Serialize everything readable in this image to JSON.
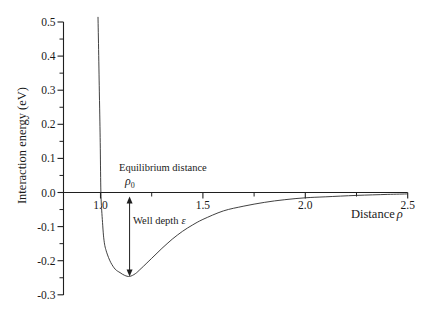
{
  "figure": {
    "background": "#ffffff",
    "line_color": "#1f1f1f",
    "curve_color": "#2b2b2b",
    "text_color": "#1a1a1a"
  },
  "chart_data": {
    "type": "line",
    "title": "",
    "xlabel": {
      "text": "Distance",
      "symbol": "ρ"
    },
    "ylabel": "Interaction energy (eV)",
    "xlim": [
      0.82,
      2.52
    ],
    "ylim": [
      -0.3,
      0.5
    ],
    "grid": false,
    "legend": null,
    "x_ticks": {
      "major": [
        {
          "value": 1.0,
          "label": "1.0"
        },
        {
          "value": 1.5,
          "label": "1.5"
        },
        {
          "value": 2.0,
          "label": "2.0"
        },
        {
          "value": 2.5,
          "label": "2.5"
        }
      ],
      "minor": [
        1.25,
        1.75,
        2.25
      ]
    },
    "y_ticks": {
      "major": [
        {
          "value": 0.5,
          "label": "0.5"
        },
        {
          "value": 0.4,
          "label": "0.4"
        },
        {
          "value": 0.3,
          "label": "0.3"
        },
        {
          "value": 0.2,
          "label": "0.2"
        },
        {
          "value": 0.1,
          "label": "0.1"
        },
        {
          "value": 0.0,
          "label": "0.0"
        },
        {
          "value": -0.1,
          "label": "-0.1"
        },
        {
          "value": -0.2,
          "label": "-0.2"
        },
        {
          "value": -0.3,
          "label": "-0.3"
        }
      ],
      "minor": [
        0.45,
        0.35,
        0.25,
        0.15,
        0.05,
        -0.05,
        -0.15,
        -0.25
      ]
    },
    "series": [
      {
        "name": "interaction-energy-potential",
        "points": [
          [
            0.988,
            0.515
          ],
          [
            0.995,
            0.27
          ],
          [
            0.999,
            0.13
          ],
          [
            1.002,
            0.0
          ],
          [
            1.008,
            -0.07
          ],
          [
            1.017,
            -0.14
          ],
          [
            1.03,
            -0.175
          ],
          [
            1.05,
            -0.205
          ],
          [
            1.072,
            -0.225
          ],
          [
            1.095,
            -0.235
          ],
          [
            1.118,
            -0.243
          ],
          [
            1.142,
            -0.246
          ],
          [
            1.17,
            -0.238
          ],
          [
            1.198,
            -0.223
          ],
          [
            1.25,
            -0.193
          ],
          [
            1.3,
            -0.164
          ],
          [
            1.35,
            -0.137
          ],
          [
            1.4,
            -0.114
          ],
          [
            1.45,
            -0.095
          ],
          [
            1.5,
            -0.079
          ],
          [
            1.6,
            -0.054
          ],
          [
            1.7,
            -0.04
          ],
          [
            1.8,
            -0.029
          ],
          [
            1.9,
            -0.021
          ],
          [
            2.0,
            -0.0155
          ],
          [
            2.1,
            -0.0125
          ],
          [
            2.25,
            -0.0085
          ],
          [
            2.4,
            -0.0056
          ],
          [
            2.5,
            -0.0042
          ]
        ]
      }
    ],
    "annotations": {
      "equilibrium": {
        "label": "Equilibrium distance",
        "symbol": "ρ",
        "subscript": "0",
        "value": 1.14
      },
      "well_depth": {
        "label": "Well depth",
        "symbol": "ε",
        "value_eV": 0.25
      },
      "arrow": {
        "x": 1.142,
        "v_top": -0.0117,
        "v_bottom": -0.246
      }
    }
  }
}
